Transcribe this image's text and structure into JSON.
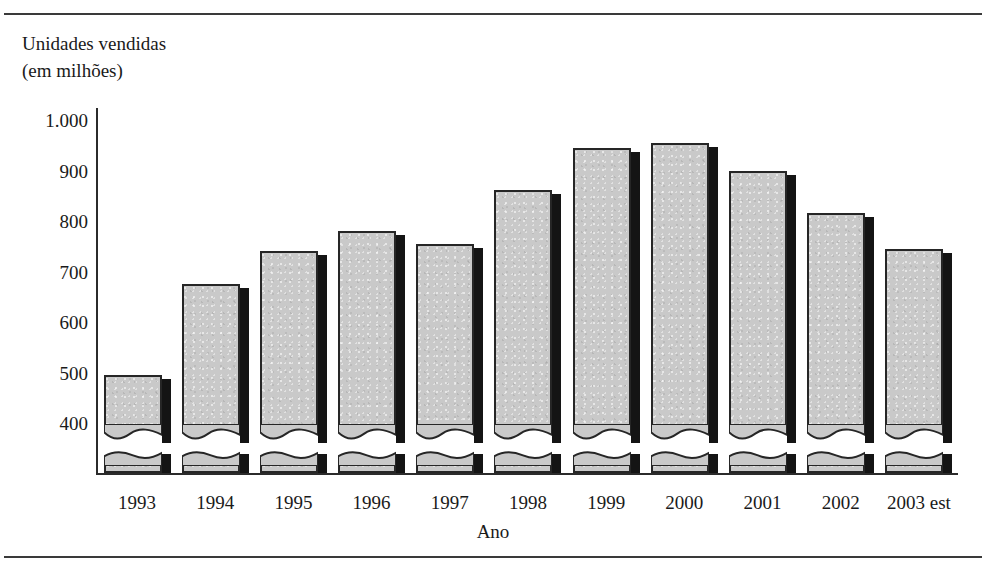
{
  "figure": {
    "y_axis_title_line1": "Unidades vendidas",
    "y_axis_title_line2": "(em milhões)",
    "x_axis_title": "Ano",
    "bar_fill_color": "#c9c9c9",
    "bar_outline_color": "#262626",
    "bar_shadow_color": "#141414",
    "axis_color": "#2b2b2b",
    "rule_color": "#3a3a3a"
  },
  "chart_data": {
    "type": "bar",
    "title": "",
    "subtitle": "",
    "xlabel": "Ano",
    "ylabel": "Unidades vendidas (em milhões)",
    "categories": [
      "1993",
      "1994",
      "1995",
      "1996",
      "1997",
      "1998",
      "1999",
      "2000",
      "2001",
      "2002",
      "2003 est"
    ],
    "values": [
      495,
      675,
      740,
      780,
      755,
      862,
      945,
      955,
      900,
      815,
      745
    ],
    "ylim": [
      400,
      1000
    ],
    "yticks": [
      400,
      500,
      600,
      700,
      800,
      900,
      1000
    ],
    "ytick_labels": [
      "400",
      "500",
      "600",
      "700",
      "800",
      "900",
      "1.000"
    ],
    "axis_broken": true,
    "axis_break_note": "bars are drawn with a torn/wavy break near the baseline indicating the value axis does not start at zero",
    "grid": false,
    "legend": null
  }
}
